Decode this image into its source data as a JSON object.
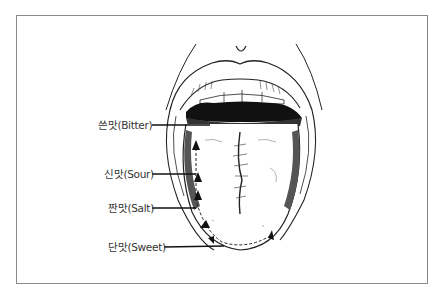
{
  "diagram": {
    "labels": [
      {
        "id": "bitter",
        "text": "쓴맛(Bitter)"
      },
      {
        "id": "sour",
        "text": "신맛(Sour)"
      },
      {
        "id": "salt",
        "text": "짠맛(Salt)"
      },
      {
        "id": "sweet",
        "text": "단맛(Sweet)"
      }
    ]
  }
}
